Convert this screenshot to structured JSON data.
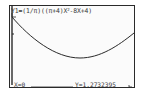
{
  "screen": {
    "equation_prefix": "Y1=(1/π)((π+4)X",
    "equation_exp": "2",
    "equation_suffix": "-8X+4)",
    "trace": {
      "x_label": "X=0",
      "y_label": "Y=1.2732395"
    },
    "cursor_glyph": "←"
  },
  "colors": {
    "ink": "#2a2a2a",
    "background": "#fbfbfb"
  }
}
